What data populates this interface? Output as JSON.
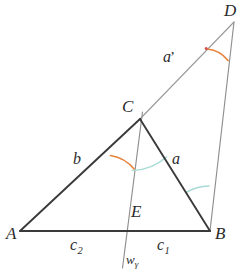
{
  "figure": {
    "type": "euclidean-geometry-diagram",
    "background_color": "#ffffff",
    "line_color": "#3a3a3a",
    "thin_line_color": "#8a8a8a",
    "arc_colors": {
      "gamma_half_orange": "#e8843c",
      "beta_cyan": "#a8dcd8",
      "delta_orange": "#e8843c"
    },
    "dot_color": "#d94f4f"
  },
  "points": {
    "A": {
      "label": "A",
      "x": 20,
      "y": 231
    },
    "B": {
      "label": "B",
      "x": 210,
      "y": 231
    },
    "C": {
      "label": "C",
      "x": 140,
      "y": 119
    },
    "D": {
      "label": "D",
      "x": 234,
      "y": 22
    },
    "E": {
      "label": "E",
      "x": 129,
      "y": 231
    }
  },
  "vertex_labels": [
    {
      "name": "A",
      "text": "A",
      "x": 6,
      "y": 236
    },
    {
      "name": "B",
      "text": "B",
      "x": 215,
      "y": 236
    },
    {
      "name": "C",
      "text": "C",
      "x": 122,
      "y": 99
    },
    {
      "name": "D",
      "text": "D",
      "x": 224,
      "y": 2
    },
    {
      "name": "E",
      "text": "E",
      "x": 131,
      "y": 206
    }
  ],
  "segment_labels": [
    {
      "name": "side-b",
      "text": "b",
      "x": 73,
      "y": 152
    },
    {
      "name": "side-a",
      "text": "a",
      "x": 172,
      "y": 152
    },
    {
      "name": "side-a-prime",
      "text": "a",
      "prime": "’",
      "x": 163,
      "y": 50
    },
    {
      "name": "segment-c2",
      "base": "c",
      "sub": "2",
      "x": 70,
      "y": 238
    },
    {
      "name": "segment-c1",
      "base": "c",
      "sub": "1",
      "x": 157,
      "y": 238
    },
    {
      "name": "bisector-w-gamma",
      "base": "w",
      "sub": "γ",
      "x": 126,
      "y": 255
    }
  ],
  "segments": [
    {
      "name": "segment-AB",
      "from": "A",
      "to": "B",
      "style": "thick"
    },
    {
      "name": "segment-AC",
      "from": "A",
      "to": "C",
      "style": "thick"
    },
    {
      "name": "segment-CB",
      "from": "C",
      "to": "B",
      "style": "thick"
    },
    {
      "name": "segment-CD",
      "from": "C",
      "to": "D",
      "style": "thin"
    },
    {
      "name": "segment-BD",
      "from": "B",
      "to": "D",
      "style": "thin"
    },
    {
      "name": "segment-bisector",
      "from": "C-extended",
      "to": "E-extended",
      "style": "thin"
    }
  ],
  "angle_marks": [
    {
      "name": "angle-gamma-half-left",
      "vertex": "C",
      "color": "#e8843c",
      "note": "half angle gamma between CA and bisector"
    },
    {
      "name": "angle-gamma-half-right",
      "vertex": "C",
      "color": "#a8dcd8",
      "note": "half angle gamma between bisector and CB"
    },
    {
      "name": "angle-beta-at-B",
      "vertex": "B",
      "color": "#a8dcd8",
      "note": "angle between BC and BD"
    },
    {
      "name": "angle-at-D",
      "vertex": "D",
      "color": "#e8843c",
      "note": "angle between DC and DB"
    }
  ]
}
